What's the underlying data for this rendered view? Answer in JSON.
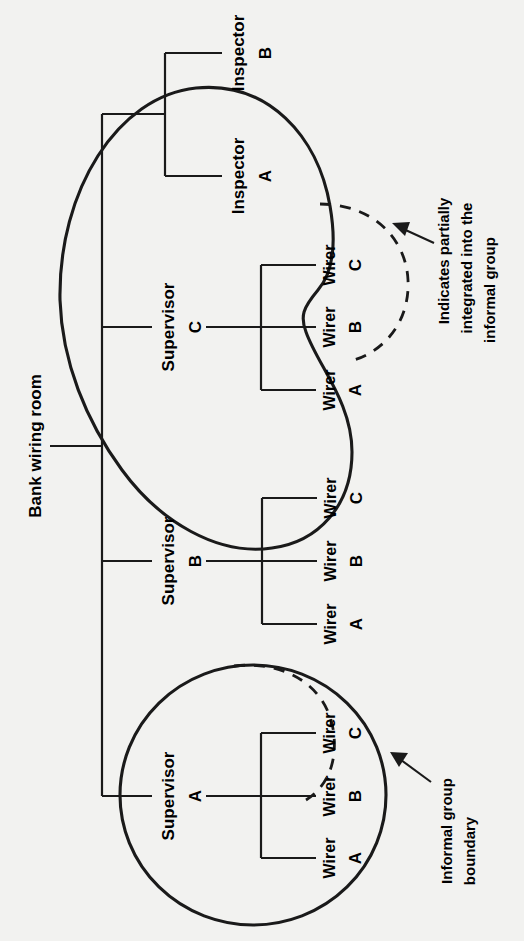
{
  "diagram": {
    "title": "Bank wiring room",
    "orientation": "rotated-90-ccw",
    "root": {
      "label": "Bank wiring room"
    },
    "inspectors": [
      {
        "role": "Inspector",
        "id": "B",
        "label": "Inspector",
        "letter": "B"
      },
      {
        "role": "Inspector",
        "id": "A",
        "label": "Inspector",
        "letter": "A"
      }
    ],
    "supervisors": [
      {
        "label": "Supervisor",
        "letter": "C",
        "wirers": [
          {
            "label": "Wirer",
            "letter": "C"
          },
          {
            "label": "Wirer",
            "letter": "B"
          },
          {
            "label": "Wirer",
            "letter": "A"
          }
        ]
      },
      {
        "label": "Supervisor",
        "letter": "B",
        "wirers": [
          {
            "label": "Wirer",
            "letter": "C"
          },
          {
            "label": "Wirer",
            "letter": "B"
          },
          {
            "label": "Wirer",
            "letter": "A"
          }
        ]
      },
      {
        "label": "Supervisor",
        "letter": "A",
        "wirers": [
          {
            "label": "Wirer",
            "letter": "C"
          },
          {
            "label": "Wirer",
            "letter": "B"
          },
          {
            "label": "Wirer",
            "letter": "A"
          }
        ]
      }
    ],
    "annotations": [
      {
        "id": "partially-integrated",
        "line1": "Indicates partially",
        "line2": "integrated into the",
        "line3": "informal group"
      },
      {
        "id": "informal-group-boundary",
        "line1": "Informal group",
        "line2": "boundary"
      }
    ],
    "legend": {
      "solid_boundary_meaning": "Informal group boundary",
      "dashed_boundary_meaning": "Indicates partially integrated into the informal group"
    }
  },
  "style": {
    "background": "#f2f2f0",
    "line_color": "#1a1a1a",
    "text_color": "#000000"
  }
}
